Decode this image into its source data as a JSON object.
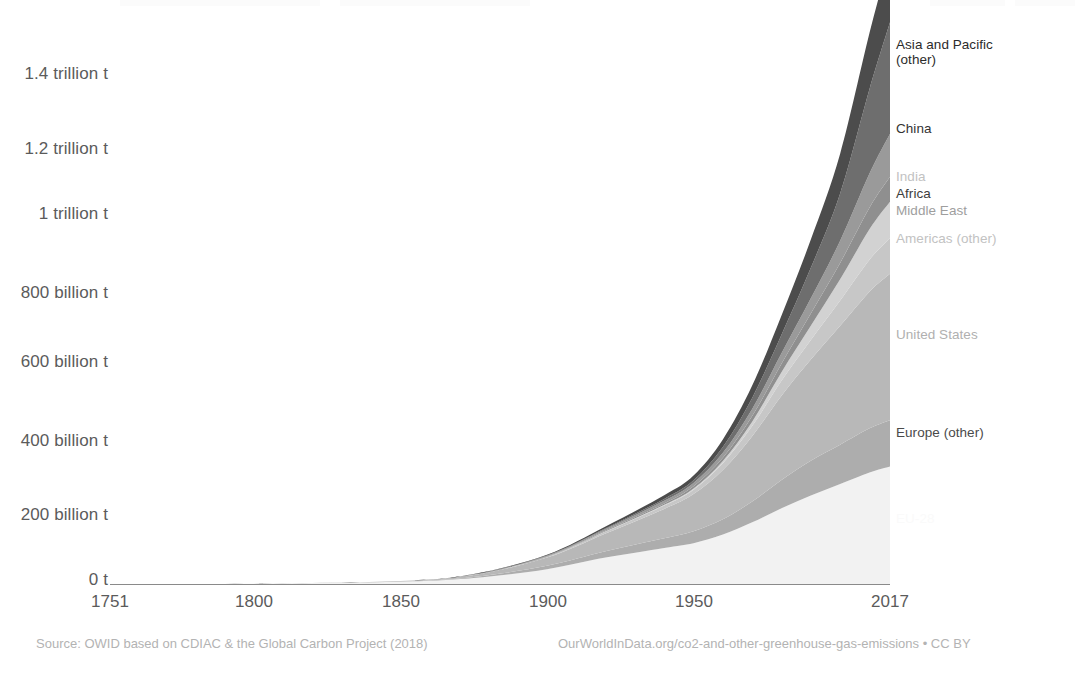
{
  "chart_data": {
    "type": "area",
    "title": "",
    "subtitle": "",
    "xlabel": "",
    "ylabel": "",
    "xlim": [
      1751,
      2017
    ],
    "ylim": [
      0,
      1500000000000
    ],
    "grid": false,
    "stacked": true,
    "legend_position": "right-inline",
    "x_tick_labels": [
      "1751",
      "1800",
      "1850",
      "1900",
      "1950",
      "2017"
    ],
    "x_ticks": [
      1751,
      1800,
      1850,
      1900,
      1950,
      2017
    ],
    "y_tick_labels": [
      "0 t",
      "200 billion t",
      "400 billion t",
      "600 billion t",
      "800 billion t",
      "1 trillion t",
      "1.2 trillion t",
      "1.4 trillion t"
    ],
    "y_ticks": [
      0,
      200000000000,
      400000000000,
      600000000000,
      800000000000,
      1000000000000,
      1200000000000,
      1400000000000
    ],
    "x": [
      1751,
      1800,
      1850,
      1875,
      1900,
      1920,
      1940,
      1950,
      1960,
      1970,
      1980,
      1990,
      2000,
      2010,
      2017
    ],
    "series": [
      {
        "name": "EU-28",
        "color": "#f2f2f2",
        "label_color": "#fafafa",
        "values": [
          0,
          1,
          6,
          16,
          40,
          71,
          97,
          110,
          133,
          166,
          204,
          238,
          269,
          300,
          316
        ]
      },
      {
        "name": "Europe (other)",
        "color": "#adadad",
        "label_color": "#4a4a4a",
        "values": [
          0,
          0,
          1,
          3,
          9,
          17,
          26,
          32,
          41,
          56,
          76,
          94,
          106,
          119,
          125
        ]
      },
      {
        "name": "United States",
        "color": "#b8b8b8",
        "label_color": "#b0b0b0",
        "values": [
          0,
          0,
          1,
          5,
          22,
          48,
          79,
          100,
          133,
          176,
          227,
          272,
          320,
          368,
          394
        ]
      },
      {
        "name": "Americas (other)",
        "color": "#c7c7c7",
        "label_color": "#c2c2c2",
        "values": [
          0,
          0,
          0,
          1,
          2,
          5,
          9,
          12,
          18,
          27,
          40,
          53,
          68,
          86,
          96
        ]
      },
      {
        "name": "Middle East",
        "color": "#d2d2d2",
        "label_color": "#9e9e9e",
        "values": [
          0,
          0,
          0,
          0,
          0,
          1,
          2,
          3,
          6,
          12,
          23,
          38,
          57,
          82,
          98
        ]
      },
      {
        "name": "Africa",
        "color": "#8f8f8f",
        "label_color": "#3d3d3d",
        "values": [
          0,
          0,
          0,
          0,
          1,
          2,
          4,
          6,
          9,
          15,
          23,
          33,
          44,
          58,
          67
        ]
      },
      {
        "name": "India",
        "color": "#9a9a9a",
        "label_color": "#c2c2c2",
        "values": [
          0,
          0,
          0,
          1,
          2,
          4,
          7,
          9,
          13,
          19,
          28,
          41,
          60,
          92,
          116
        ]
      },
      {
        "name": "China",
        "color": "#6e6e6e",
        "label_color": "#333333",
        "values": [
          0,
          0,
          0,
          0,
          1,
          2,
          5,
          7,
          16,
          30,
          50,
          82,
          127,
          227,
          300
        ]
      },
      {
        "name": "Asia and Pacific (other)",
        "color": "#4c4c4c",
        "label_color": "#2b2b2b",
        "values": [
          0,
          0,
          0,
          1,
          2,
          5,
          10,
          13,
          20,
          33,
          52,
          76,
          107,
          151,
          178
        ]
      }
    ],
    "value_units": "billion tonnes (cumulative CO2)"
  },
  "axis": {
    "y_labels": [
      "1.4 trillion t",
      "1.2 trillion t",
      "1 trillion t",
      "800 billion t",
      "600 billion t",
      "400 billion t",
      "200 billion t",
      "0 t"
    ],
    "x_labels": [
      "1751",
      "1800",
      "1850",
      "1900",
      "1950",
      "2017"
    ]
  },
  "series_labels": [
    {
      "text": "Asia and Pacific\n(other)"
    },
    {
      "text": "China"
    },
    {
      "text": "India"
    },
    {
      "text": "Africa"
    },
    {
      "text": "Middle East"
    },
    {
      "text": "Americas (other)"
    },
    {
      "text": "United States"
    },
    {
      "text": "Europe (other)"
    },
    {
      "text": "EU-28"
    }
  ],
  "footer": {
    "source": "Source: OWID based on CDIAC & the Global Carbon Project (2018)",
    "attribution": "OurWorldInData.org/co2-and-other-greenhouse-gas-emissions • CC BY"
  }
}
